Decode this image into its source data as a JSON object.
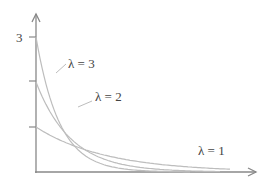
{
  "chart_data": {
    "type": "line",
    "title": "",
    "xlabel": "",
    "ylabel": "",
    "function": "f(x) = λ·e^(-λx)",
    "xlim": [
      0,
      2.6
    ],
    "ylim": [
      0,
      3.3
    ],
    "y_ticks": [
      1,
      2,
      3
    ],
    "y_tick_labels": [
      "",
      "",
      "3"
    ],
    "series": [
      {
        "name": "λ = 1",
        "lambda": 1,
        "x": [
          0,
          0.5,
          1.0,
          1.5,
          2.0,
          2.3
        ],
        "values": [
          1.0,
          0.61,
          0.37,
          0.22,
          0.14,
          0.1
        ]
      },
      {
        "name": "λ = 2",
        "lambda": 2,
        "x": [
          0,
          0.5,
          1.0,
          1.5,
          2.0,
          2.3
        ],
        "values": [
          2.0,
          0.74,
          0.27,
          0.1,
          0.04,
          0.02
        ]
      },
      {
        "name": "λ = 3",
        "lambda": 3,
        "x": [
          0,
          0.5,
          1.0,
          1.5,
          2.0
        ],
        "values": [
          3.0,
          0.67,
          0.15,
          0.03,
          0.01
        ]
      }
    ],
    "annotations": [
      {
        "text": "λ = 3",
        "target": "λ = 3"
      },
      {
        "text": "λ = 2",
        "target": "λ = 2"
      },
      {
        "text": "λ = 1",
        "target": "λ = 1"
      }
    ],
    "grid": false,
    "legend": "inline-labels"
  },
  "labels": {
    "y_tick_3": "3",
    "lam3": "λ = 3",
    "lam2": "λ = 2",
    "lam1": "λ = 1"
  },
  "colors": {
    "axis": "#888888",
    "curve": "#bdbdbd",
    "text": "#444444"
  }
}
